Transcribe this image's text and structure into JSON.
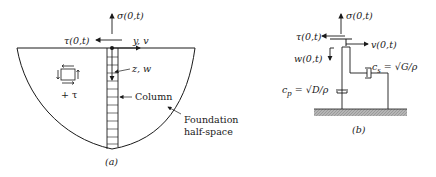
{
  "panel_a": {
    "caption": "(a)",
    "sigma_label": "σ(0,t)",
    "tau_label": "τ(0,t)",
    "yv_label": "y, v",
    "zw_label": "z, w",
    "column_label": "Column",
    "foundation_label_1": "Foundation",
    "foundation_label_2": "half-space",
    "plus_tau_label": "+ τ"
  },
  "panel_b": {
    "caption": "(b)",
    "sigma_label": "σ(0,t)",
    "tau_label": "τ(0,t)",
    "v_label": "v(0,t)",
    "w_label": "w(0,t)",
    "cs_label": "c",
    "cs_sub": "s",
    "cs_eq": " = √G/ρ",
    "cp_label": "c",
    "cp_sub": "p",
    "cp_eq": " = √D/ρ"
  },
  "colors": {
    "ink": "#1a1a1a",
    "ground": "#9a9a9a"
  }
}
